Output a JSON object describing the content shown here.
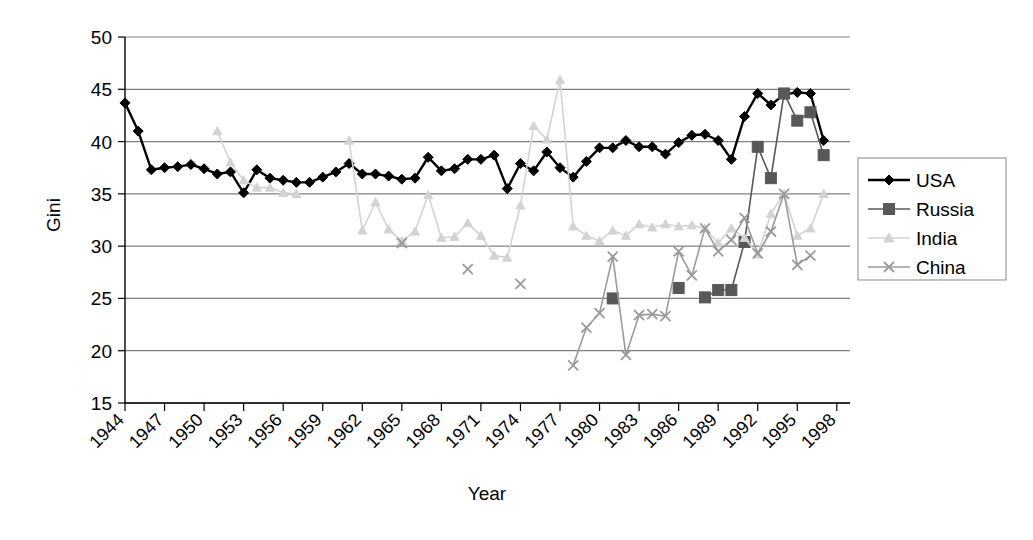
{
  "chart_data": {
    "type": "line",
    "title": "",
    "xlabel": "Year",
    "ylabel": "Gini",
    "xlim": [
      1944,
      1999
    ],
    "ylim": [
      15,
      50
    ],
    "ytick_values": [
      15,
      20,
      25,
      30,
      35,
      40,
      45,
      50
    ],
    "ytick_labels": [
      "15",
      "20",
      "25",
      "30",
      "35",
      "40",
      "45",
      "50"
    ],
    "xtick_values": [
      1944,
      1947,
      1950,
      1953,
      1956,
      1959,
      1962,
      1965,
      1968,
      1971,
      1974,
      1977,
      1980,
      1983,
      1986,
      1989,
      1992,
      1995,
      1998
    ],
    "xtick_labels": [
      "1944",
      "1947",
      "1950",
      "1953",
      "1956",
      "1959",
      "1962",
      "1965",
      "1968",
      "1971",
      "1974",
      "1977",
      "1980",
      "1983",
      "1986",
      "1989",
      "1992",
      "1995",
      "1998"
    ],
    "grid": true,
    "legend_position": "right",
    "series": [
      {
        "name": "USA",
        "color": "#000000",
        "marker": "diamond",
        "points": [
          [
            1944,
            43.7
          ],
          [
            1945,
            41.0
          ],
          [
            1946,
            37.3
          ],
          [
            1947,
            37.5
          ],
          [
            1948,
            37.6
          ],
          [
            1949,
            37.8
          ],
          [
            1950,
            37.4
          ],
          [
            1951,
            36.9
          ],
          [
            1952,
            37.1
          ],
          [
            1953,
            35.1
          ],
          [
            1954,
            37.3
          ],
          [
            1955,
            36.5
          ],
          [
            1956,
            36.3
          ],
          [
            1957,
            36.1
          ],
          [
            1958,
            36.1
          ],
          [
            1959,
            36.6
          ],
          [
            1960,
            37.1
          ],
          [
            1961,
            37.9
          ],
          [
            1962,
            36.9
          ],
          [
            1963,
            36.9
          ],
          [
            1964,
            36.7
          ],
          [
            1965,
            36.4
          ],
          [
            1966,
            36.5
          ],
          [
            1967,
            38.5
          ],
          [
            1968,
            37.2
          ],
          [
            1969,
            37.4
          ],
          [
            1970,
            38.3
          ],
          [
            1971,
            38.3
          ],
          [
            1972,
            38.7
          ],
          [
            1973,
            35.5
          ],
          [
            1974,
            37.9
          ],
          [
            1975,
            37.2
          ],
          [
            1976,
            39.0
          ],
          [
            1977,
            37.5
          ],
          [
            1978,
            36.6
          ],
          [
            1979,
            38.1
          ],
          [
            1980,
            39.4
          ],
          [
            1981,
            39.4
          ],
          [
            1982,
            40.1
          ],
          [
            1983,
            39.5
          ],
          [
            1984,
            39.5
          ],
          [
            1985,
            38.8
          ],
          [
            1986,
            39.9
          ],
          [
            1987,
            40.6
          ],
          [
            1988,
            40.7
          ],
          [
            1989,
            40.1
          ],
          [
            1990,
            38.3
          ],
          [
            1991,
            42.4
          ],
          [
            1992,
            44.6
          ],
          [
            1993,
            43.5
          ],
          [
            1994,
            44.5
          ],
          [
            1995,
            44.7
          ],
          [
            1996,
            44.6
          ],
          [
            1997,
            40.1
          ]
        ]
      },
      {
        "name": "Russia",
        "color": "#585858",
        "marker": "square",
        "points": [
          [
            1981,
            25.0
          ],
          [
            1986,
            26.0
          ],
          [
            1988,
            25.1
          ],
          [
            1989,
            25.8
          ],
          [
            1990,
            25.8
          ],
          [
            1991,
            30.4
          ],
          [
            1992,
            39.5
          ],
          [
            1993,
            36.5
          ],
          [
            1994,
            44.6
          ],
          [
            1995,
            42.0
          ],
          [
            1996,
            42.8
          ],
          [
            1997,
            38.7
          ]
        ]
      },
      {
        "name": "India",
        "color": "#d3d3d3",
        "marker": "triangle",
        "points": [
          [
            1951,
            41.0
          ],
          [
            1952,
            38.0
          ],
          [
            1953,
            36.3
          ],
          [
            1954,
            35.6
          ],
          [
            1955,
            35.6
          ],
          [
            1956,
            35.1
          ],
          [
            1957,
            35.0
          ],
          [
            1961,
            40.1
          ],
          [
            1962,
            31.5
          ],
          [
            1963,
            34.2
          ],
          [
            1964,
            31.6
          ],
          [
            1965,
            30.5
          ],
          [
            1966,
            31.4
          ],
          [
            1967,
            34.9
          ],
          [
            1968,
            30.8
          ],
          [
            1969,
            30.9
          ],
          [
            1970,
            32.2
          ],
          [
            1971,
            31.0
          ],
          [
            1972,
            29.1
          ],
          [
            1973,
            28.9
          ],
          [
            1974,
            33.9
          ],
          [
            1975,
            41.5
          ],
          [
            1976,
            40.2
          ],
          [
            1977,
            45.9
          ],
          [
            1978,
            31.9
          ],
          [
            1979,
            31.0
          ],
          [
            1980,
            30.5
          ],
          [
            1981,
            31.5
          ],
          [
            1982,
            31.0
          ],
          [
            1983,
            32.1
          ],
          [
            1984,
            31.8
          ],
          [
            1985,
            32.1
          ],
          [
            1986,
            31.9
          ],
          [
            1987,
            32.0
          ],
          [
            1988,
            31.7
          ],
          [
            1989,
            30.3
          ],
          [
            1990,
            31.7
          ],
          [
            1991,
            30.8
          ],
          [
            1992,
            29.2
          ],
          [
            1993,
            33.1
          ],
          [
            1994,
            35.0
          ],
          [
            1995,
            31.0
          ],
          [
            1996,
            31.7
          ],
          [
            1997,
            35.0
          ]
        ]
      },
      {
        "name": "China",
        "color": "#9a9a9a",
        "marker": "x",
        "points": [
          [
            1965,
            30.3
          ],
          [
            1970,
            27.8
          ],
          [
            1974,
            26.4
          ],
          [
            1978,
            18.6
          ],
          [
            1979,
            22.2
          ],
          [
            1980,
            23.6
          ],
          [
            1981,
            29.0
          ],
          [
            1982,
            19.6
          ],
          [
            1983,
            23.4
          ],
          [
            1984,
            23.5
          ],
          [
            1985,
            23.3
          ],
          [
            1986,
            29.5
          ],
          [
            1987,
            27.2
          ],
          [
            1988,
            31.7
          ],
          [
            1989,
            29.5
          ],
          [
            1990,
            30.6
          ],
          [
            1991,
            32.7
          ],
          [
            1992,
            29.3
          ],
          [
            1993,
            31.4
          ],
          [
            1994,
            35.0
          ],
          [
            1995,
            28.2
          ],
          [
            1996,
            29.1
          ]
        ]
      }
    ]
  },
  "legend": {
    "entries": [
      {
        "label": "USA"
      },
      {
        "label": "Russia"
      },
      {
        "label": "India"
      },
      {
        "label": "China"
      }
    ]
  },
  "axes": {
    "y_title": "Gini",
    "x_title": "Year"
  },
  "colors": {
    "usa": "#000000",
    "russia": "#585858",
    "india": "#d3d3d3",
    "china": "#9a9a9a",
    "grid": "#808080",
    "axis": "#000000"
  }
}
